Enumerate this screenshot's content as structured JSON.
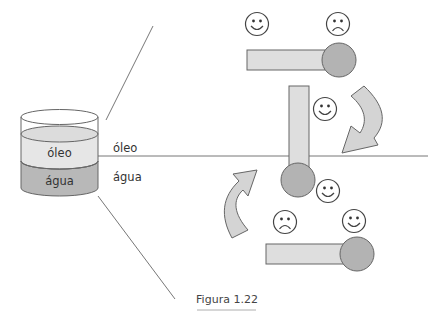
{
  "diagram": {
    "caption": "Figura 1.22",
    "container": {
      "top_layer_label": "óleo",
      "bottom_layer_label": "água"
    },
    "interface": {
      "upper_label": "óleo",
      "lower_label": "água"
    },
    "molecules": [
      {
        "id": "top",
        "orientation": "horizontal",
        "faces": [
          "happy",
          "sad"
        ]
      },
      {
        "id": "middle",
        "orientation": "vertical",
        "faces": [
          "happy",
          "happy"
        ]
      },
      {
        "id": "bottom",
        "orientation": "horizontal",
        "faces": [
          "sad",
          "happy"
        ]
      }
    ],
    "arrows": [
      "curved-arrow-down-left",
      "curved-arrow-up-right"
    ],
    "colors": {
      "oil": "#e6e6e6",
      "water": "#b8b8b8",
      "tail": "#dedede",
      "head": "#b3b3b3",
      "arrow": "#d4d4d4",
      "stroke": "#666666",
      "line": "#777777"
    }
  }
}
